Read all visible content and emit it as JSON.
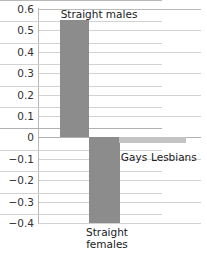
{
  "chart_data": {
    "type": "bar",
    "title": "",
    "subtitle": "",
    "xlabel": "",
    "ylabel": "",
    "categories": [
      "Straight males",
      "Straight females",
      "Gays",
      "Lesbians"
    ],
    "values": [
      0.55,
      -0.4,
      -0.025,
      -0.025
    ],
    "ylim": [
      -0.4,
      0.6
    ],
    "yticks": [
      "0.6",
      "0.5",
      "0.4",
      "0.3",
      "0.2",
      "0.1",
      "0",
      "−0.1",
      "−0.2",
      "−0.3",
      "−0.4"
    ],
    "ytick_values": [
      0.6,
      0.5,
      0.4,
      0.3,
      0.2,
      0.1,
      0,
      -0.1,
      -0.2,
      -0.3,
      -0.4
    ],
    "grid": true,
    "legend": "none",
    "series": [
      {
        "name": "effect",
        "values": [
          0.55,
          -0.4,
          -0.025,
          -0.025
        ]
      }
    ],
    "bar_colors": [
      "#8c8c8c",
      "#8c8c8c",
      "#c3c3c3",
      "#c3c3c3"
    ],
    "label_positions": [
      "above-bar",
      "below-axis",
      "below-bar",
      "below-bar"
    ]
  },
  "axis": {
    "tick_0": "0.6",
    "tick_1": "0.5",
    "tick_2": "0.4",
    "tick_3": "0.3",
    "tick_4": "0.2",
    "tick_5": "0.1",
    "tick_6": "0",
    "tick_7": "−0.1",
    "tick_8": "−0.2",
    "tick_9": "−0.3",
    "tick_10": "−0.4"
  },
  "labels": {
    "straight_males": "Straight males",
    "straight_females_line1": "Straight",
    "straight_females_line2": "females",
    "gays": "Gays",
    "lesbians": "Lesbians"
  },
  "colors": {
    "bar_dark": "#8c8c8c",
    "bar_light": "#c3c3c3",
    "grid": "#d2d2d2",
    "axis": "#b9b9b9",
    "text": "#1a1a1a",
    "tick_text": "#333333",
    "background": "#ffffff"
  }
}
